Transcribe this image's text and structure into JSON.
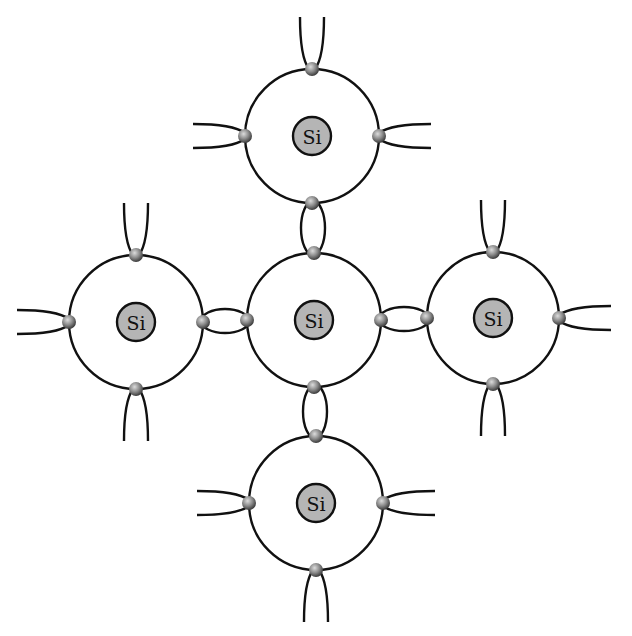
{
  "diagram": {
    "colors": {
      "line": "#111111",
      "core_fill": "#b5b5b5",
      "electron_light": "#d8d8d8",
      "electron_dark": "#4a4a4a",
      "background": "#ffffff"
    },
    "atoms": [
      {
        "id": "top",
        "label": "Si",
        "cx": 312,
        "cy": 136,
        "r": 67
      },
      {
        "id": "left",
        "label": "Si",
        "cx": 136,
        "cy": 322,
        "r": 67
      },
      {
        "id": "center",
        "label": "Si",
        "cx": 314,
        "cy": 320,
        "r": 67
      },
      {
        "id": "right",
        "label": "Si",
        "cx": 493,
        "cy": 318,
        "r": 66
      },
      {
        "id": "bottom",
        "label": "Si",
        "cx": 316,
        "cy": 503,
        "r": 67
      }
    ],
    "core_radius": 19,
    "electron_radius": 7,
    "shared_bonds": [
      {
        "from": "top",
        "to": "center"
      },
      {
        "from": "left",
        "to": "center"
      },
      {
        "from": "center",
        "to": "right"
      },
      {
        "from": "center",
        "to": "bottom"
      }
    ]
  }
}
